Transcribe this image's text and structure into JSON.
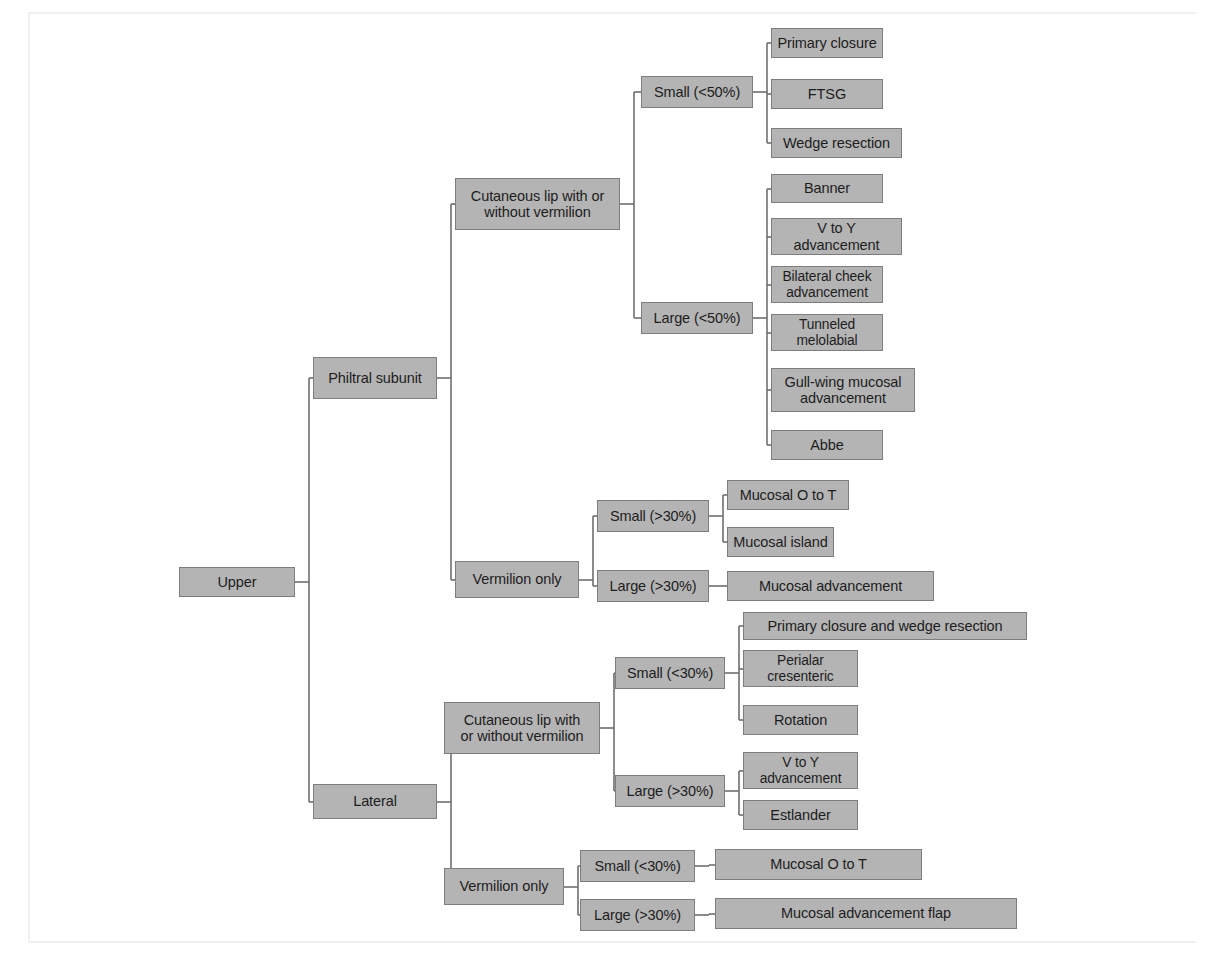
{
  "diagram": {
    "type": "tree-flowchart",
    "colors": {
      "node_fill": "#b4b4b4",
      "node_border": "#7d7d7d",
      "connector": "#6f6f6f",
      "text": "#1d1d1d",
      "background": "#ffffff"
    }
  },
  "nodes": [
    {
      "id": "upper",
      "label": "Upper",
      "x": 179,
      "y": 567,
      "w": 116,
      "h": 30
    },
    {
      "id": "philtral",
      "label": "Philtral subunit",
      "x": 313,
      "y": 357,
      "w": 124,
      "h": 42
    },
    {
      "id": "lateral",
      "label": "Lateral",
      "x": 313,
      "y": 784,
      "w": 124,
      "h": 35
    },
    {
      "id": "p-cut",
      "label": "Cutaneous lip with or\nwithout vermilion",
      "x": 455,
      "y": 178,
      "w": 165,
      "h": 52
    },
    {
      "id": "p-verm",
      "label": "Vermilion only",
      "x": 455,
      "y": 561,
      "w": 124,
      "h": 37
    },
    {
      "id": "p-cut-small",
      "label": "Small (<50%)",
      "x": 641,
      "y": 76,
      "w": 112,
      "h": 32
    },
    {
      "id": "p-cut-large",
      "label": "Large (<50%)",
      "x": 641,
      "y": 302,
      "w": 112,
      "h": 32
    },
    {
      "id": "primary-closure",
      "label": "Primary closure",
      "x": 771,
      "y": 28,
      "w": 112,
      "h": 30
    },
    {
      "id": "ftsg",
      "label": "FTSG",
      "x": 771,
      "y": 79,
      "w": 112,
      "h": 30
    },
    {
      "id": "wedge-resection",
      "label": "Wedge resection",
      "x": 771,
      "y": 128,
      "w": 131,
      "h": 30
    },
    {
      "id": "banner",
      "label": "Banner",
      "x": 771,
      "y": 174,
      "w": 112,
      "h": 29
    },
    {
      "id": "v-to-y-1",
      "label": "V to Y\nadvancement",
      "x": 771,
      "y": 218,
      "w": 131,
      "h": 37
    },
    {
      "id": "bilateral-cheek",
      "label": "Bilateral cheek\nadvancement",
      "x": 771,
      "y": 266,
      "w": 112,
      "h": 37
    },
    {
      "id": "tunneled",
      "label": "Tunneled\nmelolabial",
      "x": 771,
      "y": 314,
      "w": 112,
      "h": 37
    },
    {
      "id": "gull-wing",
      "label": "Gull-wing mucosal\nadvancement",
      "x": 771,
      "y": 368,
      "w": 144,
      "h": 44
    },
    {
      "id": "abbe",
      "label": "Abbe",
      "x": 771,
      "y": 430,
      "w": 112,
      "h": 30
    },
    {
      "id": "p-verm-small",
      "label": "Small (>30%)",
      "x": 597,
      "y": 500,
      "w": 112,
      "h": 32
    },
    {
      "id": "p-verm-large",
      "label": "Large (>30%)",
      "x": 597,
      "y": 570,
      "w": 112,
      "h": 32
    },
    {
      "id": "mucosal-o-to-t-1",
      "label": "Mucosal O to T",
      "x": 727,
      "y": 480,
      "w": 122,
      "h": 30
    },
    {
      "id": "mucosal-island",
      "label": "Mucosal island",
      "x": 727,
      "y": 527,
      "w": 107,
      "h": 30
    },
    {
      "id": "mucosal-adv",
      "label": "Mucosal advancement",
      "x": 727,
      "y": 571,
      "w": 207,
      "h": 30
    },
    {
      "id": "l-cut",
      "label": "Cutaneous lip with\nor without vermilion",
      "x": 444,
      "y": 702,
      "w": 156,
      "h": 52
    },
    {
      "id": "l-verm",
      "label": "Vermilion only",
      "x": 444,
      "y": 868,
      "w": 120,
      "h": 37
    },
    {
      "id": "l-cut-small",
      "label": "Small (<30%)",
      "x": 615,
      "y": 657,
      "w": 110,
      "h": 32
    },
    {
      "id": "l-cut-large",
      "label": "Large (>30%)",
      "x": 615,
      "y": 775,
      "w": 110,
      "h": 32
    },
    {
      "id": "primary-wedge",
      "label": "Primary closure and wedge resection",
      "x": 743,
      "y": 612,
      "w": 284,
      "h": 28
    },
    {
      "id": "perialar",
      "label": "Perialar\ncresenteric",
      "x": 743,
      "y": 650,
      "w": 115,
      "h": 37
    },
    {
      "id": "rotation",
      "label": "Rotation",
      "x": 743,
      "y": 705,
      "w": 115,
      "h": 30
    },
    {
      "id": "v-to-y-2",
      "label": "V to Y\nadvancement",
      "x": 743,
      "y": 752,
      "w": 115,
      "h": 37
    },
    {
      "id": "estlander",
      "label": "Estlander",
      "x": 743,
      "y": 800,
      "w": 115,
      "h": 30
    },
    {
      "id": "l-verm-small",
      "label": "Small (<30%)",
      "x": 580,
      "y": 850,
      "w": 115,
      "h": 32
    },
    {
      "id": "l-verm-large",
      "label": "Large (>30%)",
      "x": 580,
      "y": 899,
      "w": 115,
      "h": 32
    },
    {
      "id": "mucosal-o-to-t-2",
      "label": "Mucosal O to T",
      "x": 715,
      "y": 849,
      "w": 207,
      "h": 31
    },
    {
      "id": "mucosal-adv-flap",
      "label": "Mucosal advancement flap",
      "x": 715,
      "y": 898,
      "w": 302,
      "h": 31
    }
  ],
  "edges": [
    {
      "from": "upper",
      "to": [
        "philtral",
        "lateral"
      ]
    },
    {
      "from": "philtral",
      "to": [
        "p-cut",
        "p-verm"
      ]
    },
    {
      "from": "p-cut",
      "to": [
        "p-cut-small",
        "p-cut-large"
      ]
    },
    {
      "from": "p-cut-small",
      "to": [
        "primary-closure",
        "ftsg",
        "wedge-resection"
      ]
    },
    {
      "from": "p-cut-large",
      "to": [
        "banner",
        "v-to-y-1",
        "bilateral-cheek",
        "tunneled",
        "gull-wing",
        "abbe"
      ]
    },
    {
      "from": "p-verm",
      "to": [
        "p-verm-small",
        "p-verm-large"
      ]
    },
    {
      "from": "p-verm-small",
      "to": [
        "mucosal-o-to-t-1",
        "mucosal-island"
      ]
    },
    {
      "from": "p-verm-large",
      "to": [
        "mucosal-adv"
      ]
    },
    {
      "from": "lateral",
      "to": [
        "l-cut",
        "l-verm"
      ]
    },
    {
      "from": "l-cut",
      "to": [
        "l-cut-small",
        "l-cut-large"
      ]
    },
    {
      "from": "l-cut-small",
      "to": [
        "primary-wedge",
        "perialar",
        "rotation"
      ]
    },
    {
      "from": "l-cut-large",
      "to": [
        "v-to-y-2",
        "estlander"
      ]
    },
    {
      "from": "l-verm",
      "to": [
        "l-verm-small",
        "l-verm-large"
      ]
    },
    {
      "from": "l-verm-small",
      "to": [
        "mucosal-o-to-t-2"
      ]
    },
    {
      "from": "l-verm-large",
      "to": [
        "mucosal-adv-flap"
      ]
    }
  ]
}
